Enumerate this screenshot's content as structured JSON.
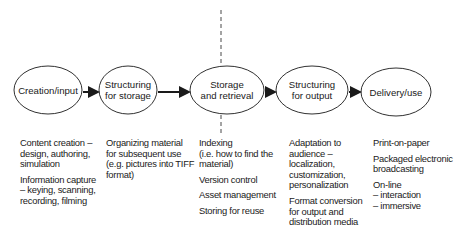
{
  "diagram": {
    "stages": [
      {
        "id": "creation",
        "label_lines": [
          "Creation/input"
        ],
        "cx": 48,
        "cy": 90,
        "rx": 34,
        "ry": 24
      },
      {
        "id": "structuring-storage",
        "label_lines": [
          "Structuring",
          "for storage"
        ],
        "cx": 128,
        "cy": 90,
        "rx": 29,
        "ry": 24
      },
      {
        "id": "storage-retrieval",
        "label_lines": [
          "Storage",
          "and retrieval"
        ],
        "cx": 227,
        "cy": 90,
        "rx": 37,
        "ry": 24
      },
      {
        "id": "structuring-output",
        "label_lines": [
          "Structuring",
          "for output"
        ],
        "cx": 312,
        "cy": 90,
        "rx": 36,
        "ry": 24
      },
      {
        "id": "delivery",
        "label_lines": [
          "Delivery/use"
        ],
        "cx": 396,
        "cy": 92,
        "rx": 35,
        "ry": 24
      }
    ],
    "connector": "arrow",
    "dashed_line_x": 221,
    "colors": {
      "stroke": "#1a1a1a",
      "text": "#1a1a1a",
      "background": "#ffffff"
    }
  },
  "columns": [
    {
      "x": 20,
      "items": [
        "Content creation –\ndesign, authoring,\nsimulation",
        "Information capture\n– keying, scanning,\nrecording, filming"
      ]
    },
    {
      "x": 106,
      "items": [
        "Organizing material\nfor subsequent use\n(e.g. pictures into TIFF\nformat)"
      ]
    },
    {
      "x": 199,
      "items": [
        "Indexing\n(i.e. how to find the\nmaterial)",
        "Version control",
        "Asset management",
        "Storing for reuse"
      ]
    },
    {
      "x": 289,
      "items": [
        "Adaptation to\naudience –\nlocalization,\ncustomization,\npersonalization",
        "Format conversion\nfor output and\ndistribution media"
      ]
    },
    {
      "x": 373,
      "items": [
        "Print-on-paper",
        "Packaged electronic\nbroadcasting",
        "On-line\n  – interaction\n  – immersive"
      ]
    }
  ]
}
